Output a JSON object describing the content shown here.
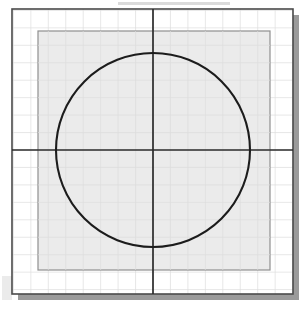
{
  "figure": {
    "canvas": {
      "width": 308,
      "height": 309,
      "background": "#ffffff"
    },
    "shadow": {
      "name": "drop-shadow",
      "color": "#9a9a9a",
      "offset_x": 6,
      "offset_y": 6,
      "x": 18,
      "y": 15,
      "width": 281,
      "height": 285
    },
    "outer_frame": {
      "name": "plot-frame",
      "x": 12,
      "y": 9,
      "width": 281,
      "height": 285,
      "fill": "#ffffff",
      "stroke": "#4a4a4a",
      "stroke_width": 1.6
    },
    "grid": {
      "name": "background-grid",
      "spacing": 17.45,
      "stroke": "#dcdcdc",
      "stroke_width": 0.7,
      "visible": true,
      "columns": 16,
      "rows": 16
    },
    "inner_rect": {
      "name": "inscribing-square",
      "x": 38,
      "y": 31,
      "width": 232,
      "height": 239,
      "fill": "#ebebeb",
      "stroke": "#8f8f8f",
      "stroke_width": 1.2
    },
    "inner_grid": {
      "name": "inner-grid",
      "stroke": "#dddddd",
      "stroke_width": 0.7
    },
    "axes": {
      "name": "axes",
      "stroke": "#2b2b2b",
      "stroke_width": 1.7,
      "horizontal_y": 150,
      "vertical_x": 153,
      "x_start": 12,
      "x_end": 293,
      "y_start": 9,
      "y_end": 294
    },
    "circle": {
      "name": "main-circle",
      "center_x": 153,
      "center_y": 150,
      "radius": 97,
      "fill": "none",
      "stroke": "#1c1c1c",
      "stroke_width": 2.1
    },
    "artifacts": [
      {
        "name": "scan-smudge-top",
        "x": 118,
        "y": 2,
        "width": 112,
        "height": 3,
        "color": "#cfcfcf",
        "opacity": 0.75
      },
      {
        "name": "scan-smudge-left",
        "x": 2,
        "y": 276,
        "width": 10,
        "height": 24,
        "color": "#e2e2e2",
        "opacity": 0.7
      }
    ]
  }
}
